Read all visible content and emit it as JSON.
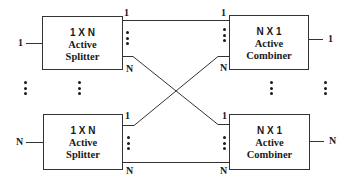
{
  "diagram": {
    "type": "optical switch architecture",
    "boxes": [
      {
        "id": "splitter-1",
        "dim": "1 X N",
        "line1": "Active",
        "line2": "Splitter",
        "input_label": "1",
        "top_port": "1",
        "bottom_port": "N"
      },
      {
        "id": "splitter-n",
        "dim": "1 X N",
        "line1": "Active",
        "line2": "Splitter",
        "input_label": "N",
        "top_port": "1",
        "bottom_port": "N"
      },
      {
        "id": "combiner-1",
        "dim": "N X 1",
        "line1": "Active",
        "line2": "Combiner",
        "output_label": "1",
        "top_port": "1",
        "bottom_port": "N"
      },
      {
        "id": "combiner-n",
        "dim": "N X 1",
        "line1": "Active",
        "line2": "Combiner",
        "output_label": "N",
        "top_port": "1",
        "bottom_port": "N"
      }
    ],
    "connections": [
      {
        "from": "splitter-1.port-1",
        "to": "combiner-1.port-1"
      },
      {
        "from": "splitter-1.port-N",
        "to": "combiner-n.port-1"
      },
      {
        "from": "splitter-n.port-1",
        "to": "combiner-1.port-N"
      },
      {
        "from": "splitter-n.port-N",
        "to": "combiner-n.port-N"
      }
    ],
    "colors": {
      "line": "#333333",
      "text": "#1a1a1a",
      "background": "#ffffff"
    }
  }
}
